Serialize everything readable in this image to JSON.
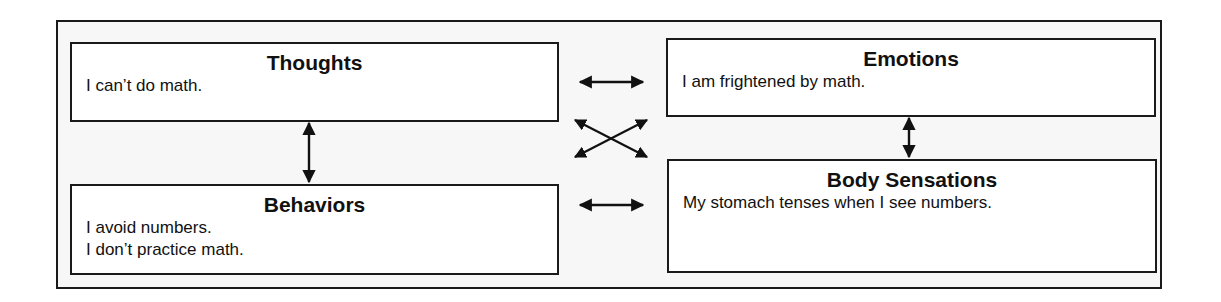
{
  "diagram": {
    "type": "cognitive-behavioral model",
    "boxes": {
      "thoughts": {
        "title": "Thoughts",
        "lines": [
          "I can’t do math."
        ]
      },
      "emotions": {
        "title": "Emotions",
        "lines": [
          "I am frightened by math."
        ]
      },
      "behaviors": {
        "title": "Behaviors",
        "lines": [
          "I avoid numbers.",
          "I don’t practice math."
        ]
      },
      "body_sensations": {
        "title": "Body Sensations",
        "lines": [
          "My stomach tenses when I see numbers."
        ]
      }
    },
    "connections": [
      {
        "from": "Thoughts",
        "to": "Emotions",
        "type": "bidirectional-arrow"
      },
      {
        "from": "Thoughts",
        "to": "Behaviors",
        "type": "bidirectional-arrow"
      },
      {
        "from": "Emotions",
        "to": "Body Sensations",
        "type": "bidirectional-arrow"
      },
      {
        "from": "Behaviors",
        "to": "Body Sensations",
        "type": "bidirectional-arrow"
      },
      {
        "from": "Thoughts",
        "to": "Body Sensations",
        "type": "bidirectional-arrow"
      },
      {
        "from": "Behaviors",
        "to": "Emotions",
        "type": "bidirectional-arrow"
      }
    ],
    "colors": {
      "stroke": "#1a1a1a",
      "box_fill": "#ffffff",
      "frame_fill": "#f7f7f7"
    }
  }
}
